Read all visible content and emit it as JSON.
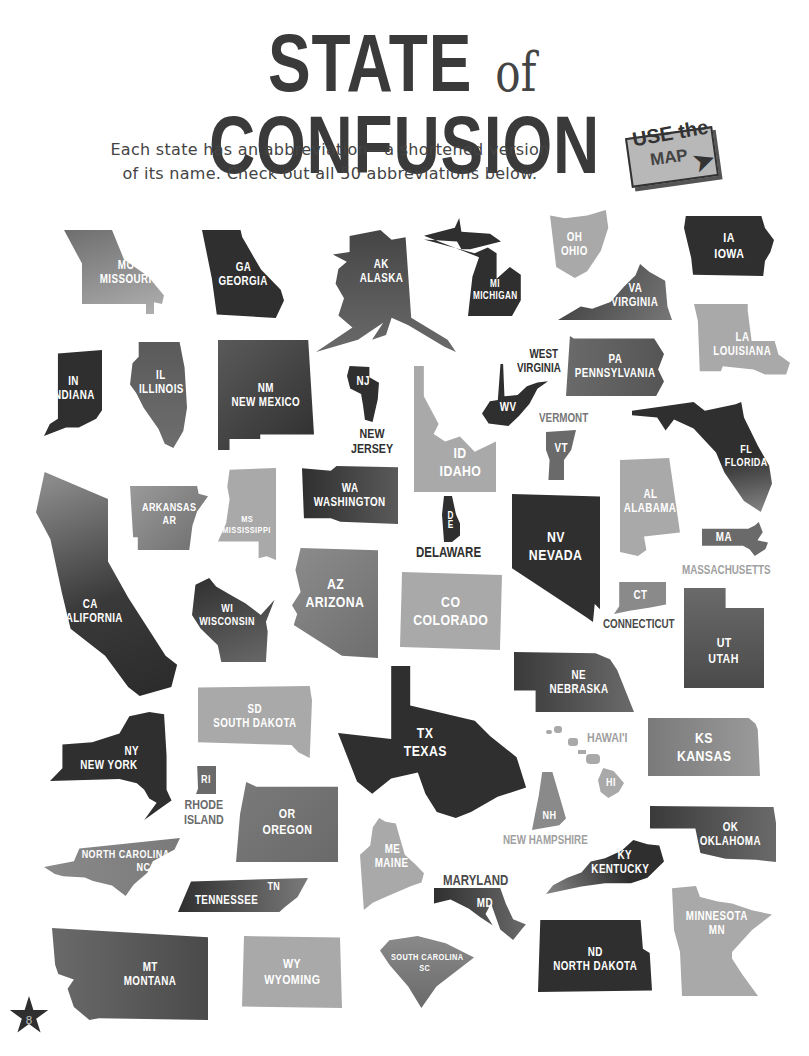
{
  "header": {
    "title_part1": "STATE",
    "title_of": "of",
    "title_part2": "CONFUSION",
    "subtitle_line1": "Each state has an abbreviation—a shortened version",
    "subtitle_line2": "of its name. Check out all 50 abbreviations below.",
    "badge_use": "USE the",
    "badge_map": "MAP",
    "badge_arrow": "➤"
  },
  "page_number": "8",
  "states": [
    {
      "abbr": "MO",
      "name": "MISSOURI"
    },
    {
      "abbr": "GA",
      "name": "GEORGIA"
    },
    {
      "abbr": "AK",
      "name": "ALASKA"
    },
    {
      "abbr": "MI",
      "name": "MICHIGAN"
    },
    {
      "abbr": "OH",
      "name": "OHIO"
    },
    {
      "abbr": "IA",
      "name": "IOWA"
    },
    {
      "abbr": "VA",
      "name": "VIRGINIA"
    },
    {
      "abbr": "IN",
      "name": "INDIANA"
    },
    {
      "abbr": "IL",
      "name": "ILLINOIS"
    },
    {
      "abbr": "NM",
      "name": "NEW MEXICO"
    },
    {
      "abbr": "NJ",
      "name": "NEW JERSEY"
    },
    {
      "abbr": "WV",
      "name": "WEST VIRGINIA"
    },
    {
      "abbr": "PA",
      "name": "PENNSYLVANIA"
    },
    {
      "abbr": "LA",
      "name": "LOUISIANA"
    },
    {
      "abbr": "ID",
      "name": "IDAHO"
    },
    {
      "abbr": "VT",
      "name": "VERMONT"
    },
    {
      "abbr": "FL",
      "name": "FLORIDA"
    },
    {
      "abbr": "CA",
      "name": "CALIFORNIA"
    },
    {
      "abbr": "AR",
      "name": "ARKANSAS"
    },
    {
      "abbr": "MS",
      "name": "MISSISSIPPI"
    },
    {
      "abbr": "WA",
      "name": "WASHINGTON"
    },
    {
      "abbr": "DE",
      "name": "DELAWARE"
    },
    {
      "abbr": "NV",
      "name": "NEVADA"
    },
    {
      "abbr": "AL",
      "name": "ALABAMA"
    },
    {
      "abbr": "MA",
      "name": "MASSACHUSETTS"
    },
    {
      "abbr": "WI",
      "name": "WISCONSIN"
    },
    {
      "abbr": "AZ",
      "name": "ARIZONA"
    },
    {
      "abbr": "CO",
      "name": "COLORADO"
    },
    {
      "abbr": "CT",
      "name": "CONNECTICUT"
    },
    {
      "abbr": "UT",
      "name": "UTAH"
    },
    {
      "abbr": "SD",
      "name": "SOUTH DAKOTA"
    },
    {
      "abbr": "NE",
      "name": "NEBRASKA"
    },
    {
      "abbr": "NY",
      "name": "NEW YORK"
    },
    {
      "abbr": "TX",
      "name": "TEXAS"
    },
    {
      "abbr": "HI",
      "name": "HAWAI'I"
    },
    {
      "abbr": "KS",
      "name": "KANSAS"
    },
    {
      "abbr": "RI",
      "name": "RHODE ISLAND"
    },
    {
      "abbr": "OR",
      "name": "OREGON"
    },
    {
      "abbr": "NH",
      "name": "NEW HAMPSHIRE"
    },
    {
      "abbr": "OK",
      "name": "OKLAHOMA"
    },
    {
      "abbr": "NC",
      "name": "NORTH CAROLINA"
    },
    {
      "abbr": "ME",
      "name": "MAINE"
    },
    {
      "abbr": "MD",
      "name": "MARYLAND"
    },
    {
      "abbr": "KY",
      "name": "KENTUCKY"
    },
    {
      "abbr": "TN",
      "name": "TENNESSEE"
    },
    {
      "abbr": "MN",
      "name": "MINNESOTA"
    },
    {
      "abbr": "MT",
      "name": "MONTANA"
    },
    {
      "abbr": "WY",
      "name": "WYOMING"
    },
    {
      "abbr": "SC",
      "name": "SOUTH CAROLINA"
    },
    {
      "abbr": "ND",
      "name": "NORTH DAKOTA"
    }
  ],
  "labels": {
    "new_jersey": "NEW\nJERSEY",
    "new_jersey_1": "NEW",
    "new_jersey_2": "JERSEY",
    "west_virginia_1": "WEST",
    "west_virginia_2": "VIRGINIA",
    "vermont": "VERMONT",
    "delaware": "DELAWARE",
    "massachusetts": "MASSACHUSETTS",
    "connecticut": "CONNECTICUT",
    "hawaii": "HAWAI'I",
    "rhode_island_1": "RHODE",
    "rhode_island_2": "ISLAND",
    "new_hampshire": "NEW HAMPSHIRE",
    "maryland": "MARYLAND"
  },
  "colors": {
    "dark": "#2f2f2f",
    "mid": "#6a6a6a",
    "light": "#a9a9a9",
    "title": "#3a3a3a"
  }
}
